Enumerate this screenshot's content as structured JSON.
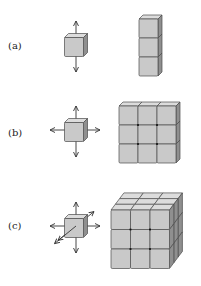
{
  "figure": {
    "panels": [
      {
        "id": "a",
        "label": "(a)",
        "unit_cube_directions": [
          "up",
          "down"
        ],
        "assembly": {
          "description": "1×1×3 column of cubes",
          "cols": 1,
          "rows": 3,
          "depth": 1
        }
      },
      {
        "id": "b",
        "label": "(b)",
        "unit_cube_directions": [
          "up",
          "down",
          "left",
          "right"
        ],
        "assembly": {
          "description": "3×3×1 slab of cubes",
          "cols": 3,
          "rows": 3,
          "depth": 1
        }
      },
      {
        "id": "c",
        "label": "(c)",
        "unit_cube_directions": [
          "up",
          "down",
          "left",
          "right",
          "front",
          "back"
        ],
        "assembly": {
          "description": "3×3×3 block of cubes",
          "cols": 3,
          "rows": 3,
          "depth": 3
        }
      }
    ],
    "colors": {
      "cube_front": "#c9c9c9",
      "cube_top": "#dcdcdc",
      "cube_side": "#8f8f8f",
      "outline": "#4a4a4a"
    }
  }
}
